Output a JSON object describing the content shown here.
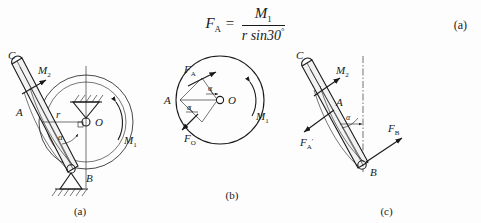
{
  "equation": {
    "lhs": "F",
    "lhs_sub": "A",
    "equals": "=",
    "numerator": "M",
    "numerator_sub": "1",
    "denominator": "r sin30",
    "denominator_sup": "°",
    "number": "(a)"
  },
  "figures": [
    {
      "id": "figure-a",
      "caption": "(a)",
      "description": "Mechanism: disk pinned at O driven by moment M1, slotted lever BC pinned at B",
      "labels": {
        "point_c": "C",
        "point_a": "A",
        "point_b": "B",
        "center_o": "O",
        "radius": "r",
        "angle": "α",
        "moment_disk": "M",
        "moment_disk_sub": "1",
        "moment_lever": "M",
        "moment_lever_sub": "2"
      }
    },
    {
      "id": "figure-b",
      "caption": "(b)",
      "description": "Free body diagram of the disk showing force FA at A, reaction FO at O, moment M1",
      "labels": {
        "point_a": "A",
        "center_o": "O",
        "force_a": "F",
        "force_a_sub": "A",
        "force_o": "F",
        "force_o_sub": "O",
        "moment_disk": "M",
        "moment_disk_sub": "1",
        "angle_upper": "α",
        "angle_lower": "α"
      }
    },
    {
      "id": "figure-c",
      "caption": "(c)",
      "description": "Free body diagram of lever BC showing reaction F'A, pin reaction FB at B, moment M2",
      "labels": {
        "point_c": "C",
        "point_a": "A",
        "point_b": "B",
        "force_a_prime": "F",
        "force_a_prime_sub": "A",
        "force_a_prime_mark": "′",
        "force_b": "F",
        "force_b_sub": "B",
        "moment_lever": "M",
        "moment_lever_sub": "2",
        "angle": "α"
      }
    }
  ],
  "colors": {
    "ink": "#1a1a1a",
    "background": "#fdfdfd",
    "bar_fill": "#f2f2f2"
  }
}
